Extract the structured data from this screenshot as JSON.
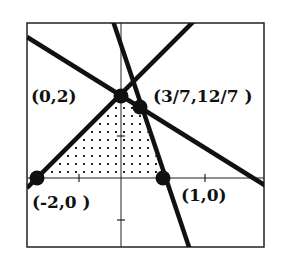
{
  "diagram": {
    "type": "linear-inequality-feasible-region",
    "axes": {
      "origin_px": [
        121,
        178
      ],
      "unit_px": 42,
      "ticks": {
        "x": [
          -1,
          1,
          2
        ],
        "y": [
          -1,
          1
        ]
      }
    },
    "lines": [
      {
        "name": "y = x + 2",
        "through": [
          [
            -2,
            0
          ],
          [
            0,
            2
          ]
        ]
      },
      {
        "name": "y = -4x + 4",
        "through": [
          [
            1,
            0
          ],
          [
            0.4286,
            1.7143
          ]
        ]
      },
      {
        "name": "2x + 3y = 6",
        "through": [
          [
            0,
            2
          ],
          [
            3,
            0
          ]
        ]
      }
    ],
    "shaded_region": "dotted quadrilateral with vertices (-2,0), (0,2), (3/7,12/7), (1,0)",
    "vertices": [
      {
        "id": "v1",
        "label": "(0,2)",
        "x": 0,
        "y": 2
      },
      {
        "id": "v2",
        "label": "(3/7,12/7 )",
        "x": 0.4286,
        "y": 1.7143
      },
      {
        "id": "v3",
        "label": "(-2,0 )",
        "x": -2,
        "y": 0
      },
      {
        "id": "v4",
        "label": "(1,0)",
        "x": 1,
        "y": 0
      }
    ],
    "colors": {
      "ink": "#111111",
      "background": "#ffffff"
    }
  }
}
